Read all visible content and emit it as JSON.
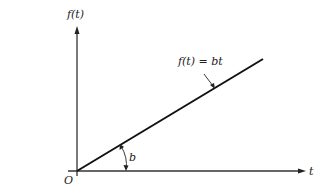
{
  "diagram": {
    "y_axis_label": "f(t)",
    "x_axis_label": "t",
    "origin_label": "O",
    "line_label": "f(t) = bt",
    "angle_label": "b",
    "colors": {
      "background": "#ffffff",
      "axes": "#333333",
      "line": "#111111",
      "text": "#222222"
    }
  }
}
